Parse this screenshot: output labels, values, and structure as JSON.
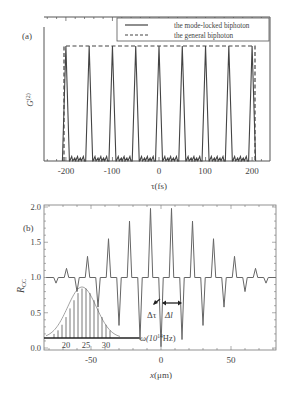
{
  "chart_data": [
    {
      "panel": "(a)",
      "type": "line",
      "title": "",
      "xlabel": "τ(fs)",
      "ylabel": "G(2)",
      "xlim": [
        -250,
        235
      ],
      "ylim": [
        0,
        1.15
      ],
      "xticks": [
        -200,
        -100,
        0,
        100,
        200
      ],
      "xtick_labels": [
        "-200",
        "-100",
        "0",
        "100",
        "200"
      ],
      "yticks": [],
      "grid": false,
      "legend_position": "top-right",
      "legend": [
        "the mode-locked biphoton",
        "the general biphoton"
      ],
      "series": [
        {
          "name": "the mode-locked biphoton",
          "style": "solid",
          "peak_positions_fs": [
            -200,
            -150,
            -100,
            -50,
            0,
            50,
            100,
            150,
            200
          ],
          "peak_values": [
            1,
            1,
            1,
            1,
            1,
            1,
            1,
            1,
            1
          ],
          "baseline_ripple": 0.04
        },
        {
          "name": "the general biphoton",
          "style": "dashed",
          "x": [
            -205,
            -205,
            205,
            205
          ],
          "y": [
            0,
            1,
            1,
            0
          ]
        }
      ]
    },
    {
      "panel": "(b)",
      "type": "line",
      "title": "",
      "xlabel": "x(μm)",
      "ylabel": "R_CC",
      "xlim": [
        -83,
        83
      ],
      "ylim": [
        0,
        2.0
      ],
      "xticks": [
        -50,
        0,
        50
      ],
      "xtick_labels": [
        "-50",
        "0",
        "50"
      ],
      "yticks": [
        0.0,
        0.5,
        1.0,
        1.5,
        2.0
      ],
      "ytick_labels": [
        "0.0",
        "0.5",
        "1.0",
        "1.5",
        "2.0"
      ],
      "grid": false,
      "baseline": 1.0,
      "series": [
        {
          "name": "R_CC",
          "peaks": [
            {
              "x": -67.5,
              "y": 1.13
            },
            {
              "x": -52.5,
              "y": 1.3
            },
            {
              "x": -37.5,
              "y": 1.55
            },
            {
              "x": -22.5,
              "y": 1.8
            },
            {
              "x": -7.5,
              "y": 1.98
            },
            {
              "x": 7.5,
              "y": 1.98
            },
            {
              "x": 22.5,
              "y": 1.8
            },
            {
              "x": 37.5,
              "y": 1.55
            },
            {
              "x": 52.5,
              "y": 1.3
            },
            {
              "x": 67.5,
              "y": 1.13
            }
          ],
          "dips": [
            {
              "x": -75,
              "y": 0.92
            },
            {
              "x": -60,
              "y": 0.8
            },
            {
              "x": -45,
              "y": 0.58
            },
            {
              "x": -30,
              "y": 0.32
            },
            {
              "x": -15,
              "y": 0.12
            },
            {
              "x": 0,
              "y": 0.02
            },
            {
              "x": 15,
              "y": 0.12
            },
            {
              "x": 30,
              "y": 0.32
            },
            {
              "x": 45,
              "y": 0.58
            },
            {
              "x": 60,
              "y": 0.8
            },
            {
              "x": 75,
              "y": 0.92
            }
          ]
        }
      ],
      "annotations": [
        "Δτ",
        "Δl"
      ],
      "inset": {
        "type": "stem+gaussian",
        "xlabel": "ω(10^14Hz)",
        "xticks": [
          20,
          25,
          30
        ],
        "center": 24,
        "stems_x": [
          17,
          18,
          19,
          20,
          21,
          22,
          23,
          24,
          25,
          26,
          27,
          28,
          29,
          30,
          31
        ],
        "stems_rel_height": [
          0.08,
          0.15,
          0.26,
          0.41,
          0.58,
          0.74,
          0.88,
          0.97,
          0.97,
          0.88,
          0.74,
          0.58,
          0.41,
          0.26,
          0.15
        ]
      }
    }
  ],
  "panel_a": {
    "label": "(a)",
    "ylabel": "G",
    "ylabel_sup": "(2)",
    "xlabel": "τ(fs)",
    "xtick_labels": [
      "-200",
      "-100",
      "0",
      "100",
      "200"
    ],
    "legend": {
      "solid_label": "the mode-locked biphoton",
      "dashed_label": "the general biphoton"
    }
  },
  "panel_b": {
    "label": "(b)",
    "ylabel": "R",
    "ylabel_sub": "CC",
    "xlabel_x": "x",
    "xlabel_unit": "(μm)",
    "xtick_labels": [
      "-50",
      "0",
      "50"
    ],
    "ytick_labels": [
      "0.0",
      "0.5",
      "1.0",
      "1.5",
      "2.0"
    ],
    "annot_dtau": "Δτ",
    "annot_dl": "Δl",
    "inset_axis_label": "ω(10",
    "inset_axis_sup": "14",
    "inset_axis_unit": "Hz)",
    "inset_ticks": [
      "20",
      "25",
      "30"
    ]
  }
}
